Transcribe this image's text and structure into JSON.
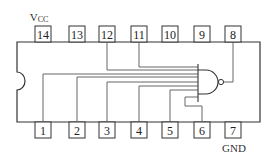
{
  "diagram": {
    "type": "ic-pinout",
    "labels": {
      "vcc": "V",
      "vcc_sub": "CC",
      "gnd": "GND"
    },
    "top_pins": [
      {
        "number": "14"
      },
      {
        "number": "13"
      },
      {
        "number": "12"
      },
      {
        "number": "11"
      },
      {
        "number": "10"
      },
      {
        "number": "9"
      },
      {
        "number": "8"
      }
    ],
    "bottom_pins": [
      {
        "number": "1"
      },
      {
        "number": "2"
      },
      {
        "number": "3"
      },
      {
        "number": "4"
      },
      {
        "number": "5"
      },
      {
        "number": "6"
      },
      {
        "number": "7"
      }
    ],
    "gate": {
      "kind": "NAND",
      "inputs": [
        "1",
        "2",
        "3",
        "4",
        "5",
        "6",
        "11",
        "12"
      ],
      "output": "8"
    },
    "colors": {
      "line": "#333333",
      "wire": "#555555",
      "background": "#ffffff"
    }
  }
}
